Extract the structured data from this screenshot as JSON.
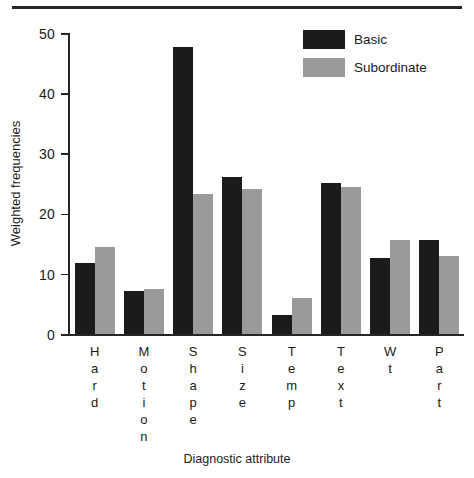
{
  "chart_data": {
    "type": "bar",
    "title": "",
    "xlabel": "Diagnostic attribute",
    "ylabel": "Weighted frequencies",
    "categories": [
      "Hard",
      "Motion",
      "Shape",
      "Size",
      "Temp",
      "Text",
      "Wt",
      "Part"
    ],
    "series": [
      {
        "name": "Basic",
        "color": "#1b1b1b",
        "values": [
          11.8,
          7.2,
          47.7,
          26.1,
          3.2,
          25.1,
          12.6,
          15.6
        ]
      },
      {
        "name": "Subordinate",
        "color": "#9a9a9a",
        "values": [
          14.4,
          7.5,
          23.2,
          24.1,
          6.0,
          24.5,
          15.7,
          13.0
        ]
      }
    ],
    "ylim": [
      0,
      50
    ],
    "yticks": [
      0,
      10,
      20,
      30,
      40,
      50
    ],
    "ytick_labels": [
      "0",
      "10",
      "20",
      "30",
      "40",
      "50"
    ],
    "grid": false,
    "legend_position": "top-right"
  },
  "legend": {
    "items": [
      {
        "label": "Basic",
        "color": "#1b1b1b"
      },
      {
        "label": "Subordinate",
        "color": "#9a9a9a"
      }
    ]
  },
  "axis": {
    "y_title": "Weighted frequencies",
    "x_title": "Diagnostic attribute"
  },
  "colors": {
    "basic": "#1b1b1b",
    "subordinate": "#9a9a9a",
    "axis": "#262626",
    "background": "#ffffff"
  }
}
